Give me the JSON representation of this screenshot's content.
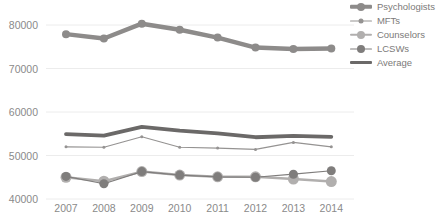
{
  "chart_data": {
    "type": "line",
    "title": "",
    "xlabel": "",
    "ylabel": "",
    "x": [
      2007,
      2008,
      2009,
      2010,
      2011,
      2012,
      2013,
      2014
    ],
    "x_tick_labels": [
      "2007",
      "2008",
      "2009",
      "2010",
      "2011",
      "2012",
      "2013",
      "2014"
    ],
    "y_ticks": [
      80000,
      70000,
      60000,
      50000,
      40000
    ],
    "y_tick_labels": [
      "80000",
      "70000",
      "60000",
      "50000",
      "40000"
    ],
    "ylim": [
      38500,
      82000
    ],
    "grid": true,
    "legend_position": "top-right",
    "series": [
      {
        "name": "Psychologists",
        "color": "#8d8b8a",
        "line_width": 4.5,
        "marker": "circle",
        "marker_size": 8,
        "values": [
          77900,
          76900,
          80300,
          78900,
          77100,
          74800,
          74500,
          74600
        ]
      },
      {
        "name": "MFTs",
        "color": "#959392",
        "line_width": 1.2,
        "marker": "circle",
        "marker_size": 3,
        "values": [
          52000,
          51900,
          54300,
          51900,
          51700,
          51400,
          53000,
          52000
        ]
      },
      {
        "name": "Counselors",
        "color": "#b1afae",
        "line_width": 2.5,
        "marker": "circle",
        "marker_size": 11,
        "values": [
          45000,
          44100,
          46300,
          45500,
          45100,
          45100,
          44600,
          44000
        ]
      },
      {
        "name": "LCSWs",
        "color": "#7f7d7c",
        "line_width": 1.2,
        "marker": "circle",
        "marker_size": 9,
        "values": [
          45200,
          43500,
          46300,
          45500,
          45100,
          45000,
          45700,
          46500
        ]
      },
      {
        "name": "Average",
        "color": "#6b6968",
        "line_width": 3.8,
        "marker": "none",
        "marker_size": 0,
        "values": [
          54900,
          54550,
          56600,
          55700,
          55100,
          54200,
          54500,
          54300
        ]
      }
    ]
  },
  "colors": {
    "background": "#ffffff",
    "grid": "#ececec",
    "tick_text": "#8a8a8a",
    "legend_text": "#7c7a79"
  }
}
